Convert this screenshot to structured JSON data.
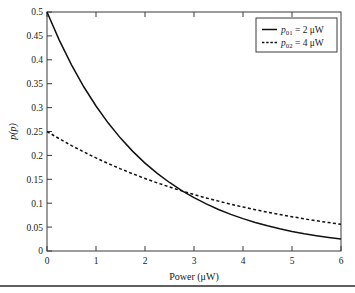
{
  "chart_data": {
    "type": "line",
    "title": "",
    "xlabel": "Power (μW)",
    "ylabel": "p(p)",
    "xlim": [
      0,
      6
    ],
    "ylim": [
      0,
      0.5
    ],
    "grid": false,
    "legend_position": "top-right",
    "xticks": [
      "0",
      "1",
      "2",
      "3",
      "4",
      "5",
      "6"
    ],
    "xtick_values": [
      0,
      1,
      2,
      3,
      4,
      5,
      6
    ],
    "yticks": [
      "0",
      "0.05",
      "0.1",
      "0.15",
      "0.2",
      "0.25",
      "0.3",
      "0.35",
      "0.4",
      "0.45",
      "0.5"
    ],
    "ytick_values": [
      0,
      0.05,
      0.1,
      0.15,
      0.2,
      0.25,
      0.3,
      0.35,
      0.4,
      0.45,
      0.5
    ],
    "series": [
      {
        "name": "p01 = 2 μW",
        "style": "solid",
        "color": "#111111",
        "p0": 2,
        "x": [
          0,
          0.25,
          0.5,
          0.75,
          1,
          1.25,
          1.5,
          1.75,
          2,
          2.25,
          2.5,
          2.75,
          3,
          3.25,
          3.5,
          3.75,
          4,
          4.25,
          4.5,
          4.75,
          5,
          5.25,
          5.5,
          5.75,
          6
        ],
        "values": [
          0.5,
          0.4412,
          0.3894,
          0.3436,
          0.3033,
          0.2676,
          0.2362,
          0.2084,
          0.1839,
          0.1623,
          0.1433,
          0.1264,
          0.1116,
          0.0985,
          0.0869,
          0.0767,
          0.0677,
          0.0597,
          0.0527,
          0.0465,
          0.041,
          0.0362,
          0.032,
          0.0282,
          0.0249
        ]
      },
      {
        "name": "p02 = 4 μW",
        "style": "dashed",
        "color": "#111111",
        "p0": 4,
        "x": [
          0,
          0.25,
          0.5,
          0.75,
          1,
          1.25,
          1.5,
          1.75,
          2,
          2.25,
          2.5,
          2.75,
          3,
          3.25,
          3.5,
          3.75,
          4,
          4.25,
          4.5,
          4.75,
          5,
          5.25,
          5.5,
          5.75,
          6
        ],
        "values": [
          0.25,
          0.2349,
          0.2206,
          0.2073,
          0.1947,
          0.183,
          0.1719,
          0.1615,
          0.1517,
          0.1425,
          0.1339,
          0.1258,
          0.1181,
          0.111,
          0.1043,
          0.098,
          0.092,
          0.0864,
          0.0812,
          0.0763,
          0.0717,
          0.0673,
          0.0632,
          0.0594,
          0.0558
        ]
      }
    ],
    "annotations": {
      "intersection_x": 2.77,
      "intersection_y": 0.125
    }
  },
  "legend": {
    "entries": [
      {
        "symbol": "p",
        "subscript": "01",
        "equals_value": " = 2 μW",
        "full": "p01 = 2 μW",
        "line_style": "solid"
      },
      {
        "symbol": "p",
        "subscript": "02",
        "equals_value": " = 4 μW",
        "full": "p02 = 4 μW",
        "line_style": "dashed"
      }
    ]
  },
  "axes": {
    "x_title": "Power (μW)",
    "y_title_symbol": "p",
    "y_title_arg": "(p)",
    "y_title_full": "p(p)"
  }
}
